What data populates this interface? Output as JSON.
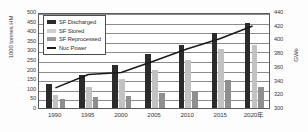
{
  "chart_data": {
    "type": "bar",
    "title": "",
    "xlabel": "",
    "ylabel": "1000 tonnes HM",
    "y2label": "GWe",
    "categories": [
      "1990",
      "1995",
      "2000",
      "2005",
      "2010",
      "2015",
      "2020年"
    ],
    "ylim": [
      0,
      500
    ],
    "yticks": [
      500,
      450,
      400,
      350,
      300,
      250,
      200,
      150,
      100,
      50,
      0
    ],
    "y2lim": [
      300,
      440
    ],
    "y2ticks": [
      440,
      420,
      400,
      380,
      360,
      340,
      320,
      300
    ],
    "grid": true,
    "legend_position": "upper-left",
    "series": [
      {
        "name": "SF Discharged",
        "type": "bar",
        "axis": "left",
        "color": "#2b2b2b",
        "values": [
          125,
          170,
          225,
          280,
          330,
          390,
          445
        ]
      },
      {
        "name": "SF Stored",
        "type": "bar",
        "axis": "left",
        "color": "#c2c2c2",
        "values": [
          70,
          110,
          150,
          200,
          250,
          305,
          330
        ]
      },
      {
        "name": "SF Reprocessed",
        "type": "bar",
        "axis": "left",
        "color": "#8f8f8f",
        "values": [
          45,
          57,
          65,
          80,
          88,
          145,
          108
        ]
      },
      {
        "name": "Nuc Power",
        "type": "line",
        "axis": "right",
        "color": "#1a1a1a",
        "values": [
          330,
          350,
          353,
          370,
          388,
          403,
          422
        ]
      }
    ]
  },
  "legend": {
    "items": [
      {
        "label": "SF Discharged"
      },
      {
        "label": "SF Stored"
      },
      {
        "label": "SF Reprocessed"
      },
      {
        "label": "Nuc Power"
      }
    ]
  },
  "axes": {
    "left_title": "1000 tonnes HM",
    "right_title": "GWe"
  }
}
